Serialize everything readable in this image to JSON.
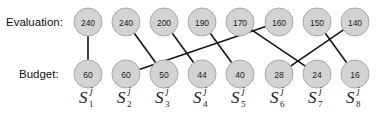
{
  "labels": {
    "evaluation": "Evaluation:",
    "budget": "Budget:"
  },
  "evaluation_nodes": [
    "240",
    "240",
    "200",
    "190",
    "170",
    "160",
    "150",
    "140"
  ],
  "budget_nodes": [
    "60",
    "60",
    "50",
    "44",
    "40",
    "28",
    "24",
    "16"
  ],
  "node_labels": [
    {
      "base": "S",
      "sup": "j",
      "sub": "1"
    },
    {
      "base": "S",
      "sup": "j",
      "sub": "2"
    },
    {
      "base": "S",
      "sup": "j",
      "sub": "3"
    },
    {
      "base": "S",
      "sup": "j",
      "sub": "4"
    },
    {
      "base": "S",
      "sup": "j",
      "sub": "5"
    },
    {
      "base": "S",
      "sup": "j",
      "sub": "6"
    },
    {
      "base": "S",
      "sup": "j",
      "sub": "7"
    },
    {
      "base": "S",
      "sup": "j",
      "sub": "8"
    }
  ],
  "edges": [
    {
      "from_evaluation": 1,
      "to_budget": 1
    },
    {
      "from_evaluation": 2,
      "to_budget": 3
    },
    {
      "from_evaluation": 3,
      "to_budget": 4
    },
    {
      "from_evaluation": 4,
      "to_budget": 5
    },
    {
      "from_evaluation": 5,
      "to_budget": 7
    },
    {
      "from_evaluation": 6,
      "to_budget": 2
    },
    {
      "from_evaluation": 7,
      "to_budget": 8
    },
    {
      "from_evaluation": 8,
      "to_budget": 6
    }
  ],
  "colors": {
    "node_fill": "#d3d3d3",
    "node_stroke": "#a8a8a8",
    "edge": "#151515"
  }
}
